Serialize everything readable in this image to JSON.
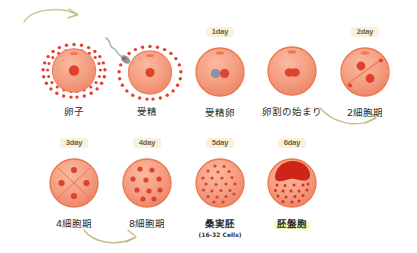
{
  "infographic": {
    "title_visible": false,
    "background": "#ffffff",
    "palette": {
      "cell_fill_light": "#f8a488",
      "cell_fill": "#f29a7e",
      "cell_stroke": "#e8704a",
      "nucleus": "#e0412a",
      "dark_mass": "#cf2418",
      "corona_dot": "#e0412a",
      "sperm": "#9aa0ad",
      "pronucleus_blue": "#8193ad",
      "badge_bg": "#fbf0d8",
      "badge_text": "#6b6250",
      "highlight": "#fdfbb0",
      "arrow": "#bdb77a",
      "caption_text": "#2b2b2b"
    },
    "arrows": [
      {
        "name": "arrow-top-left",
        "direction": "right"
      },
      {
        "name": "arrow-right-down",
        "direction": "down-right"
      },
      {
        "name": "arrow-bottom-left",
        "direction": "right"
      }
    ],
    "stages": [
      {
        "id": "ovum",
        "day_label": "",
        "caption": "卵子",
        "sub_caption": "",
        "art": "ovum",
        "highlight": false,
        "bold": false
      },
      {
        "id": "fertilization",
        "day_label": "",
        "caption": "受精",
        "sub_caption": "",
        "art": "fertilization",
        "highlight": false,
        "bold": false
      },
      {
        "id": "zygote",
        "day_label": "1day",
        "caption": "受精卵",
        "sub_caption": "",
        "art": "zygote",
        "highlight": false,
        "bold": false
      },
      {
        "id": "cleavage-start",
        "day_label": "",
        "caption": "卵割の始まり",
        "sub_caption": "",
        "art": "cleavage",
        "highlight": false,
        "bold": false
      },
      {
        "id": "two-cell",
        "day_label": "2day",
        "caption": "2細胞期",
        "sub_caption": "",
        "art": "twocell",
        "highlight": false,
        "bold": false
      },
      {
        "id": "four-cell",
        "day_label": "3day",
        "caption": "4細胞期",
        "sub_caption": "",
        "art": "fourcell",
        "highlight": false,
        "bold": false
      },
      {
        "id": "eight-cell",
        "day_label": "4day",
        "caption": "8細胞期",
        "sub_caption": "",
        "art": "eightcell",
        "highlight": false,
        "bold": false
      },
      {
        "id": "morula",
        "day_label": "5day",
        "caption": "桑実胚",
        "sub_caption": "(16-32 Cells)",
        "art": "morula",
        "highlight": false,
        "bold": true
      },
      {
        "id": "blastocyst",
        "day_label": "6day",
        "caption": "胚盤胞",
        "sub_caption": "",
        "art": "blastocyst",
        "highlight": true,
        "bold": true
      }
    ]
  }
}
